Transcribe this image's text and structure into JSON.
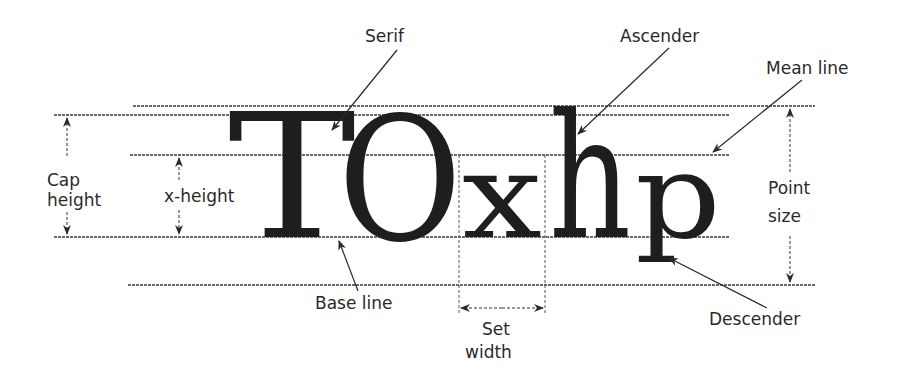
{
  "diagram": {
    "specimen": {
      "glyphs": [
        "T",
        "O",
        "x",
        "h",
        "p"
      ],
      "text": "TOxhp"
    },
    "guidelines": {
      "top": {
        "y": 106,
        "x1": 133,
        "x2": 815
      },
      "cap_line": {
        "y": 115,
        "x1": 54,
        "x2": 730
      },
      "mean_line": {
        "y": 155,
        "x1": 130,
        "x2": 730
      },
      "base_line": {
        "y": 237,
        "x1": 54,
        "x2": 730
      },
      "bottom": {
        "y": 285,
        "x1": 128,
        "x2": 815
      }
    },
    "labels": {
      "serif": "Serif",
      "ascender": "Ascender",
      "mean_line": "Mean line",
      "cap_height_line1": "Cap",
      "cap_height_line2": "height",
      "x_height": "x-height",
      "point_size_line1": "Point",
      "point_size_line2": "size",
      "base_line": "Base line",
      "set_width_line1": "Set",
      "set_width_line2": "width",
      "descender": "Descender"
    },
    "colors": {
      "ink": "#1e1e1e",
      "label": "#2a2a2a",
      "background": "#ffffff"
    }
  }
}
